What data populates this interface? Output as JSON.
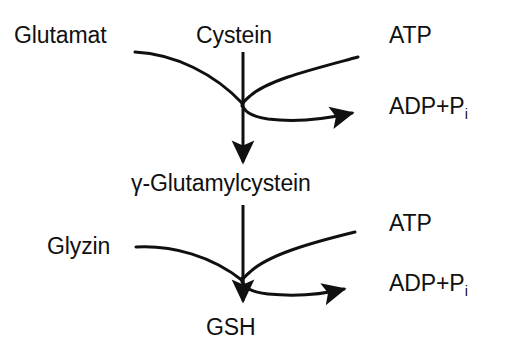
{
  "diagram": {
    "line_color": "#101010",
    "text_color": "#101010",
    "background_color": "#ffffff",
    "labels": {
      "glutamat": "Glutamat",
      "cystein": "Cystein",
      "atp_top": "ATP",
      "adp_top_main": "ADP+P",
      "adp_top_sub": "i",
      "gamma_glutamylcystein": "γ-Glutamylcystein",
      "atp_bottom": "ATP",
      "glyzin": "Glyzin",
      "adp_bottom_main": "ADP+P",
      "adp_bottom_sub": "i",
      "gsh": "GSH"
    },
    "reactions": [
      {
        "name": "glutamate-cysteine-ligase",
        "substrates": [
          "Glutamat",
          "Cystein"
        ],
        "cofactor_in": "ATP",
        "cofactor_out": "ADP+Pi",
        "product": "γ-Glutamylcystein"
      },
      {
        "name": "glutathione-synthetase",
        "substrates": [
          "γ-Glutamylcystein",
          "Glyzin"
        ],
        "cofactor_in": "ATP",
        "cofactor_out": "ADP+Pi",
        "product": "GSH"
      }
    ]
  }
}
